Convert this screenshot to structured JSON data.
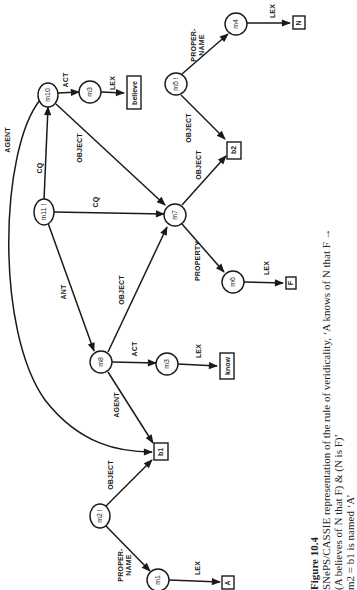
{
  "figure": {
    "orientation": "rotated-90-ccw",
    "nodes": {
      "m10": "m10",
      "m3_top": "m3",
      "believe": "believe",
      "m5": "m5 !",
      "m4": "m4",
      "N": "N",
      "m11": "m11 !",
      "m7": "m7",
      "b2": "b2",
      "m6": "m6",
      "F": "F",
      "m8": "m8",
      "m3_mid": "m3",
      "know": "know",
      "b1": "b1",
      "m2": "m2 !",
      "m1": "m1",
      "A": "A"
    },
    "edges": {
      "agent_top": "AGENT",
      "act_top": "ACT",
      "lex_believe": "LEX",
      "cq_vertical": "CQ",
      "object_m10_m7": "OBJECT",
      "cq_m11_m7": "CQ",
      "ant": "ANT",
      "object_m8_m7": "OBJECT",
      "act_mid": "ACT",
      "lex_know": "LEX",
      "agent_m8_b1": "AGENT",
      "propername_m5_1": "PROPER-",
      "propername_m5_2": "NAME",
      "lex_N": "LEX",
      "object_m5_b2": "OBJECT",
      "object_m7_b2": "OBJECT",
      "property": "PROPERTY",
      "lex_F": "LEX",
      "object_m2_b1": "OBJECT",
      "propername_m2_1": "PROPER-",
      "propername_m2_2": "NAME",
      "lex_A": "LEX"
    },
    "caption": {
      "title": "Figure 10.4",
      "line1": "SNePS/CASSIE representation of the rule of veridicality, ‘A knows of N that F →",
      "line2": "(A believes of N that F) & (N is F)’",
      "line3": "m2  = b1 is named ‘A’"
    }
  }
}
